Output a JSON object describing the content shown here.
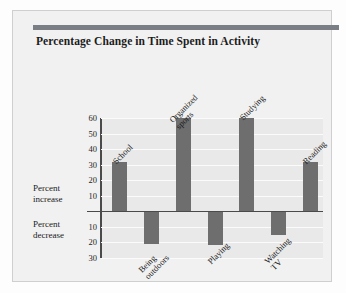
{
  "chart_title": "Percentage Change in Time Spent in Activity",
  "axis": {
    "positive_ticks": [
      "60",
      "50",
      "40",
      "30",
      "20",
      "10"
    ],
    "negative_ticks": [
      "10",
      "20",
      "30"
    ],
    "increase_label_line1": "Percent",
    "increase_label_line2": "increase",
    "decrease_label_line1": "Percent",
    "decrease_label_line2": "decrease"
  },
  "labels": {
    "school": "School",
    "being_outdoors_l1": "Being",
    "being_outdoors_l2": "outdoors",
    "organized_sports_l1": "Organized",
    "organized_sports_l2": "sports",
    "playing": "Playing",
    "studying": "Studying",
    "watching_tv_l1": "Watching",
    "watching_tv_l2": "TV",
    "reading": "Reading"
  },
  "colors": {
    "bar": "#6e6e6e",
    "accent": "#7a7f86",
    "plot_background": "#e9e9e9",
    "card_background": "#f1f1f1",
    "axis": "#4a4a4a",
    "gridline": "#fbfbfb",
    "text": "#1a1a1a"
  },
  "chart_data": {
    "type": "bar",
    "title": "Percentage Change in Time Spent in Activity",
    "xlabel": "",
    "ylabel": "Percent increase / Percent decrease",
    "ylim": [
      -30,
      60
    ],
    "grid": true,
    "legend": "none",
    "yticks": [
      -30,
      -20,
      -10,
      10,
      20,
      30,
      40,
      50,
      60
    ],
    "ytick_labels": [
      "30",
      "20",
      "10",
      "10",
      "20",
      "30",
      "40",
      "50",
      "60"
    ],
    "categories": [
      "School",
      "Being outdoors",
      "Organized sports",
      "Playing",
      "Studying",
      "Watching TV",
      "Reading"
    ],
    "values": [
      32,
      -21,
      60,
      -22,
      60,
      -15,
      32
    ],
    "units": "percent"
  }
}
